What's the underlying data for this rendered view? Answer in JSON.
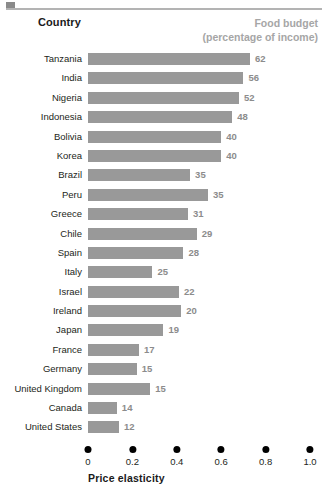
{
  "header": {
    "country_label": "Country",
    "value_header_line1": "Food budget",
    "value_header_line2": "(percentage of income)"
  },
  "axis": {
    "title": "Price elasticity",
    "ticks": [
      "0",
      "0.2",
      "0.4",
      "0.6",
      "0.8",
      "1.0"
    ]
  },
  "colors": {
    "bar": "#999999",
    "value_text": "#8c8c8c",
    "header_gray": "#a6a6a6",
    "tick_dot": "#000000",
    "text": "#231f20"
  },
  "chart_data": {
    "type": "bar",
    "title": "",
    "xlabel": "Price elasticity",
    "ylabel": "Country",
    "xlim": [
      0,
      1.0
    ],
    "xticks": [
      0,
      0.2,
      0.4,
      0.6,
      0.8,
      1.0
    ],
    "grid": false,
    "legend": "none",
    "orientation": "horizontal",
    "value_label_header": "Food budget (percentage of income)",
    "categories": [
      "Tanzania",
      "India",
      "Nigeria",
      "Indonesia",
      "Bolivia",
      "Korea",
      "Brazil",
      "Peru",
      "Greece",
      "Chile",
      "Spain",
      "Italy",
      "Israel",
      "Ireland",
      "Japan",
      "France",
      "Germany",
      "United Kingdom",
      "Canada",
      "United States"
    ],
    "series": [
      {
        "name": "Price elasticity",
        "values": [
          0.73,
          0.7,
          0.68,
          0.65,
          0.6,
          0.6,
          0.46,
          0.54,
          0.45,
          0.49,
          0.43,
          0.29,
          0.41,
          0.42,
          0.34,
          0.23,
          0.22,
          0.28,
          0.13,
          0.14
        ]
      },
      {
        "name": "Food budget (percentage of income)",
        "values": [
          62,
          56,
          52,
          48,
          40,
          40,
          35,
          35,
          31,
          29,
          28,
          25,
          22,
          20,
          19,
          17,
          15,
          15,
          14,
          12
        ]
      }
    ],
    "rows": [
      {
        "country": "Tanzania",
        "elasticity": 0.73,
        "food_budget": 62
      },
      {
        "country": "India",
        "elasticity": 0.7,
        "food_budget": 56
      },
      {
        "country": "Nigeria",
        "elasticity": 0.68,
        "food_budget": 52
      },
      {
        "country": "Indonesia",
        "elasticity": 0.65,
        "food_budget": 48
      },
      {
        "country": "Bolivia",
        "elasticity": 0.6,
        "food_budget": 40
      },
      {
        "country": "Korea",
        "elasticity": 0.6,
        "food_budget": 40
      },
      {
        "country": "Brazil",
        "elasticity": 0.46,
        "food_budget": 35
      },
      {
        "country": "Peru",
        "elasticity": 0.54,
        "food_budget": 35
      },
      {
        "country": "Greece",
        "elasticity": 0.45,
        "food_budget": 31
      },
      {
        "country": "Chile",
        "elasticity": 0.49,
        "food_budget": 29
      },
      {
        "country": "Spain",
        "elasticity": 0.43,
        "food_budget": 28
      },
      {
        "country": "Italy",
        "elasticity": 0.29,
        "food_budget": 25
      },
      {
        "country": "Israel",
        "elasticity": 0.41,
        "food_budget": 22
      },
      {
        "country": "Ireland",
        "elasticity": 0.42,
        "food_budget": 20
      },
      {
        "country": "Japan",
        "elasticity": 0.34,
        "food_budget": 19
      },
      {
        "country": "France",
        "elasticity": 0.23,
        "food_budget": 17
      },
      {
        "country": "Germany",
        "elasticity": 0.22,
        "food_budget": 15
      },
      {
        "country": "United Kingdom",
        "elasticity": 0.28,
        "food_budget": 15
      },
      {
        "country": "Canada",
        "elasticity": 0.13,
        "food_budget": 14
      },
      {
        "country": "United States",
        "elasticity": 0.14,
        "food_budget": 12
      }
    ]
  }
}
